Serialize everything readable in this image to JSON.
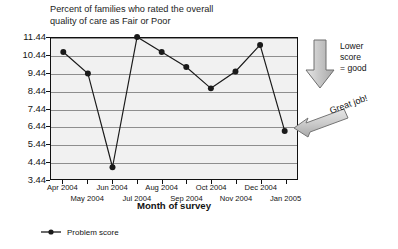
{
  "chart_data": {
    "type": "line",
    "title": "Percent of families who rated the overall\nquality of care as Fair or Poor",
    "xlabel": "Month of survey",
    "ylabel": "",
    "grid": true,
    "legend_position": "bottom-left",
    "ylim": [
      3.44,
      11.44
    ],
    "ytick_labels": [
      "11.44",
      "10.44",
      "9.44",
      "8.44",
      "7.44",
      "6.44",
      "5.44",
      "4.44",
      "3.44"
    ],
    "ytick_values": [
      11.44,
      10.44,
      9.44,
      8.44,
      7.44,
      6.44,
      5.44,
      4.44,
      3.44
    ],
    "categories": [
      "Apr 2004",
      "May 2004",
      "Jun 2004",
      "Jul 2004",
      "Aug 2004",
      "Sep 2004",
      "Oct 2004",
      "Nov 2004",
      "Dec 2004",
      "Jan 2005"
    ],
    "series": [
      {
        "name": "Problem score",
        "values": [
          10.65,
          9.44,
          4.15,
          11.5,
          10.65,
          9.8,
          8.6,
          9.55,
          11.05,
          6.2
        ]
      }
    ],
    "annotations": [
      {
        "name": "lower-score",
        "text": "Lower\nscore\n= good",
        "icon": "arrow-down-icon"
      },
      {
        "name": "great-job",
        "text": "Great job!",
        "icon": "arrow-left-icon"
      }
    ],
    "colors": {
      "plot_background": "#f1f1f1",
      "gridline": "#8e8e8e",
      "axis": "#111111",
      "series_line": "#1a1a1a",
      "annotation_fill": "#c8c8c8",
      "annotation_stroke": "#6e6e6e"
    }
  },
  "legend": {
    "label": "Problem score"
  }
}
